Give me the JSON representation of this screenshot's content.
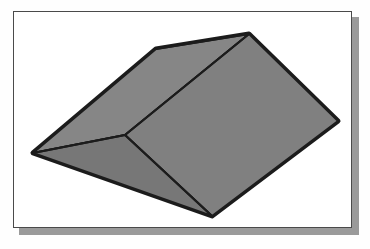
{
  "figure": {
    "caption_remnant": "",
    "frame": {
      "background_color": "#ffffff",
      "border_color": "#4a4a4a",
      "shadow_color": "#9a9a9a"
    },
    "object": {
      "name": "hip-roof-wedge-solid",
      "description": "Grey shaded three-dimensional wedge / hip-roof solid shown in oblique projection",
      "face_colors": {
        "top_left_slope": "#868686",
        "right_slope": "#808080",
        "left_triangle": "#777777",
        "extruded_edge": "#2b2b2b"
      },
      "outline_color": "#1c1c1c",
      "vertices": {
        "apex_top": [
          248,
          33
        ],
        "ridge_bend": [
          155,
          48
        ],
        "left_point": [
          32,
          152
        ],
        "y_junction": [
          124,
          134
        ],
        "bottom_point": [
          211,
          215
        ],
        "right_point": [
          337,
          120
        ]
      }
    }
  }
}
